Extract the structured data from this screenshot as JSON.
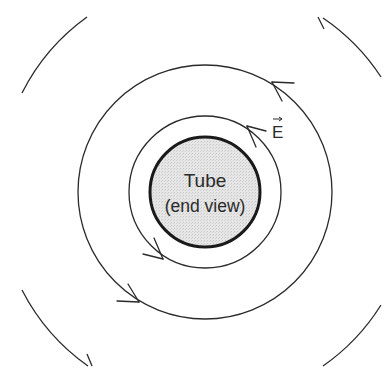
{
  "diagram": {
    "tube": {
      "line1": "Tube",
      "line2": "(end view)",
      "fill": "#e3e3e3",
      "stroke": "#1a1a1a"
    },
    "field_label": "E",
    "field_label_vector_arrow": "→",
    "line_color": "#2a2a2a",
    "field_direction": "counterclockwise"
  }
}
